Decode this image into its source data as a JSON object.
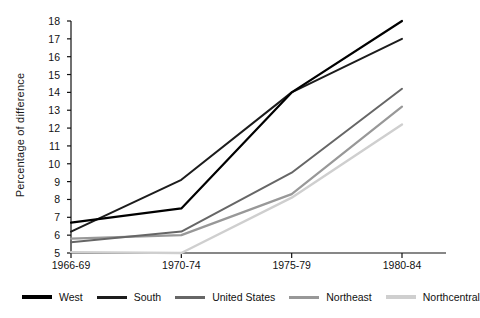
{
  "chart_data": {
    "type": "line",
    "title": "",
    "xlabel": "",
    "ylabel": "Percentage  of difference",
    "categories": [
      "1966-69",
      "1970-74",
      "1975-79",
      "1980-84"
    ],
    "ylim": [
      5,
      18
    ],
    "yticks": [
      5,
      6,
      7,
      8,
      9,
      10,
      11,
      12,
      13,
      14,
      15,
      16,
      17,
      18
    ],
    "ytick_labels": [
      "5",
      "6",
      "7",
      "8",
      "9",
      "10",
      "11",
      "12",
      "13",
      "14",
      "15",
      "16",
      "17",
      "18"
    ],
    "grid": false,
    "legend_position": "bottom",
    "series": [
      {
        "name": "West",
        "color": "#000000",
        "width": 2.2,
        "values": [
          6.7,
          7.5,
          14.0,
          18.0
        ]
      },
      {
        "name": "South",
        "color": "#1c1c1c",
        "width": 2.0,
        "values": [
          6.2,
          9.1,
          14.0,
          17.0
        ]
      },
      {
        "name": "United States",
        "color": "#666666",
        "width": 2.0,
        "values": [
          5.6,
          6.2,
          9.5,
          14.2
        ]
      },
      {
        "name": "Northeast",
        "color": "#989898",
        "width": 2.2,
        "values": [
          5.8,
          6.0,
          8.3,
          13.2
        ]
      },
      {
        "name": "Northcentral",
        "color": "#cfcfcf",
        "width": 2.4,
        "values": [
          5.05,
          5.0,
          8.1,
          12.2
        ]
      }
    ]
  },
  "legend": {
    "items": [
      {
        "label": "West"
      },
      {
        "label": "South"
      },
      {
        "label": "United States"
      },
      {
        "label": "Northeast"
      },
      {
        "label": "Northcentral"
      }
    ]
  }
}
